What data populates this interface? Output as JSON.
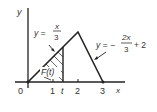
{
  "diagram": {
    "axes": {
      "x_label": "x",
      "y_label": "y",
      "origin_label": "0"
    },
    "ticks": [
      {
        "label": "1",
        "x": 1
      },
      {
        "label": "t",
        "x": 1.4
      },
      {
        "label": "2",
        "x": 2
      },
      {
        "label": "3",
        "x": 3
      }
    ],
    "left_line": {
      "lhs": "y =",
      "num": "x",
      "den": "3"
    },
    "right_line": {
      "lhs": "y = −",
      "num": "2x",
      "den": "3",
      "rhs": "+ 2"
    },
    "shaded_region_label": "F(t)",
    "colors": {
      "stroke": "#222222",
      "text": "#333333",
      "background": "#ffffff"
    }
  }
}
